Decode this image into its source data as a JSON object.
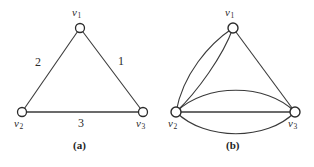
{
  "figure": {
    "background_color": "#ffffff",
    "ink_color": "#2b2b2b",
    "panels": [
      {
        "id": "a",
        "caption": "(a)",
        "caption_pos": {
          "x": 73,
          "y": 140
        },
        "type": "weighted-simple-graph",
        "vertices": [
          {
            "id": "v1",
            "label": "v",
            "subscript": "1",
            "cx": 80,
            "cy": 28,
            "r": 4.5,
            "label_pos": {
              "x": 72,
              "y": 7
            }
          },
          {
            "id": "v2",
            "label": "v",
            "subscript": "2",
            "cx": 22,
            "cy": 112,
            "r": 4.5,
            "label_pos": {
              "x": 14,
              "y": 118
            }
          },
          {
            "id": "v3",
            "label": "v",
            "subscript": "3",
            "cx": 143,
            "cy": 112,
            "r": 4.5,
            "label_pos": {
              "x": 136,
              "y": 118
            }
          }
        ],
        "edges": [
          {
            "from": "v1",
            "to": "v2",
            "weight": "2",
            "weight_pos": {
              "x": 35,
              "y": 56
            }
          },
          {
            "from": "v1",
            "to": "v3",
            "weight": "1",
            "weight_pos": {
              "x": 118,
              "y": 55
            }
          },
          {
            "from": "v2",
            "to": "v3",
            "weight": "3",
            "weight_pos": {
              "x": 78,
              "y": 117
            }
          }
        ]
      },
      {
        "id": "b",
        "caption": "(b)",
        "caption_pos": {
          "x": 69,
          "y": 140
        },
        "type": "multigraph",
        "vertices": [
          {
            "id": "v1",
            "label": "v",
            "subscript": "1",
            "cx": 76,
            "cy": 28,
            "r": 5,
            "label_pos": {
              "x": 68,
              "y": 7
            }
          },
          {
            "id": "v2",
            "label": "v",
            "subscript": "2",
            "cx": 19,
            "cy": 112,
            "r": 5,
            "label_pos": {
              "x": 11,
              "y": 118
            }
          },
          {
            "id": "v3",
            "label": "v",
            "subscript": "3",
            "cx": 138,
            "cy": 112,
            "r": 5,
            "label_pos": {
              "x": 131,
              "y": 118
            }
          }
        ],
        "edge_multiplicity": [
          {
            "pair": "v1-v2",
            "count": 2
          },
          {
            "pair": "v1-v3",
            "count": 1
          },
          {
            "pair": "v2-v3",
            "count": 3
          }
        ]
      }
    ]
  }
}
